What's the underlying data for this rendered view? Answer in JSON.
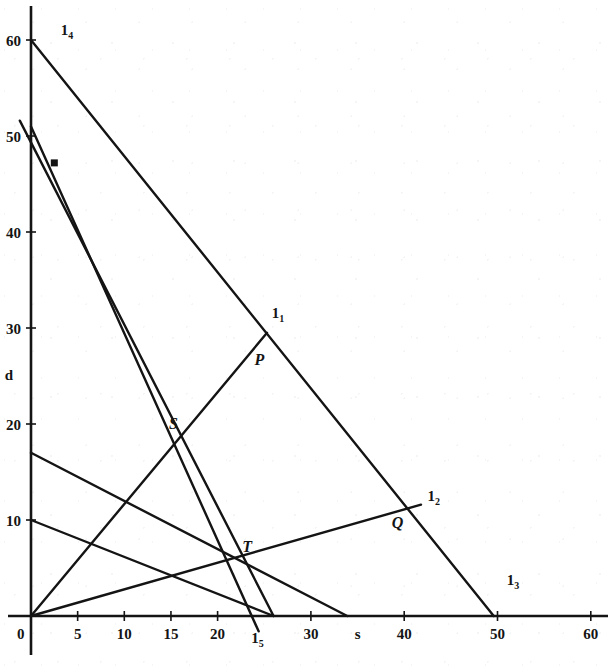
{
  "chart_data": {
    "type": "line",
    "title": "",
    "xlabel": "s",
    "ylabel": "d",
    "xlim": [
      0,
      62
    ],
    "ylim": [
      0,
      62
    ],
    "grid": false,
    "legend": "none",
    "x_ticks": [
      {
        "value": 0,
        "label": "0"
      },
      {
        "value": 5,
        "label": "5"
      },
      {
        "value": 10,
        "label": "10"
      },
      {
        "value": 15,
        "label": "15"
      },
      {
        "value": 20,
        "label": "20"
      },
      {
        "value": 30,
        "label": "30"
      },
      {
        "value": 40,
        "label": "40"
      },
      {
        "value": 50,
        "label": "50"
      },
      {
        "value": 60,
        "label": "60"
      }
    ],
    "y_ticks": [
      {
        "value": 0,
        "label": "0"
      },
      {
        "value": 10,
        "label": "10"
      },
      {
        "value": 20,
        "label": "20"
      },
      {
        "value": 30,
        "label": "30"
      },
      {
        "value": 40,
        "label": "40"
      },
      {
        "value": 50,
        "label": "50"
      },
      {
        "value": 60,
        "label": "60"
      }
    ],
    "series": [
      {
        "name": "l1",
        "label": "1",
        "label_sub": "1",
        "label_xy": [
          25.8,
          31.0
        ],
        "points": [
          [
            0,
            0
          ],
          [
            25.3,
            29.5
          ]
        ]
      },
      {
        "name": "l2",
        "label": "1",
        "label_sub": "2",
        "label_xy": [
          42.5,
          12.0
        ],
        "points": [
          [
            0,
            0
          ],
          [
            41.8,
            11.6
          ]
        ]
      },
      {
        "name": "l3",
        "label": "1",
        "label_sub": "3",
        "label_xy": [
          51.0,
          3.2
        ],
        "points": [
          [
            0,
            60
          ],
          [
            49.6,
            0
          ]
        ]
      },
      {
        "name": "l4",
        "label": "1",
        "label_sub": "4",
        "label_xy": [
          3.2,
          60.5
        ],
        "points": [
          [
            -1.2,
            51.6
          ],
          [
            26.0,
            0
          ]
        ]
      },
      {
        "name": "l5",
        "label": "1",
        "label_sub": "5",
        "label_xy": [
          23.6,
          -2.8
        ],
        "points": [
          [
            0,
            51.0
          ],
          [
            24.4,
            -1.6
          ]
        ]
      },
      {
        "name": "constraint-a",
        "label": "",
        "label_sub": "",
        "label_xy": [
          0,
          0
        ],
        "points": [
          [
            0,
            17.0
          ],
          [
            33.9,
            0
          ]
        ]
      },
      {
        "name": "constraint-b",
        "label": "",
        "label_sub": "",
        "label_xy": [
          0,
          0
        ],
        "points": [
          [
            0,
            10.0
          ],
          [
            26.0,
            0
          ]
        ]
      }
    ],
    "marked_points": [
      {
        "name": "P",
        "label": "P",
        "x": 23.0,
        "y": 26.6,
        "label_dx": 9,
        "label_dy": 4
      },
      {
        "name": "S",
        "label": "S",
        "x": 16.6,
        "y": 19.2,
        "label_dx": -17,
        "label_dy": -3
      },
      {
        "name": "T",
        "label": "T",
        "x": 22.2,
        "y": 5.6,
        "label_dx": 4,
        "label_dy": -10
      },
      {
        "name": "Q",
        "label": "Q",
        "x": 39.1,
        "y": 11.0,
        "label_dx": -4,
        "label_dy": 18
      }
    ],
    "dot_markers": [
      {
        "name": "optimum-dot",
        "x": 2.5,
        "y": 47.2
      }
    ]
  },
  "axes": {
    "x_axis_name": "s",
    "x_axis_name_at": 35.0,
    "y_axis_name": "d",
    "y_axis_name_at": 25.2
  }
}
